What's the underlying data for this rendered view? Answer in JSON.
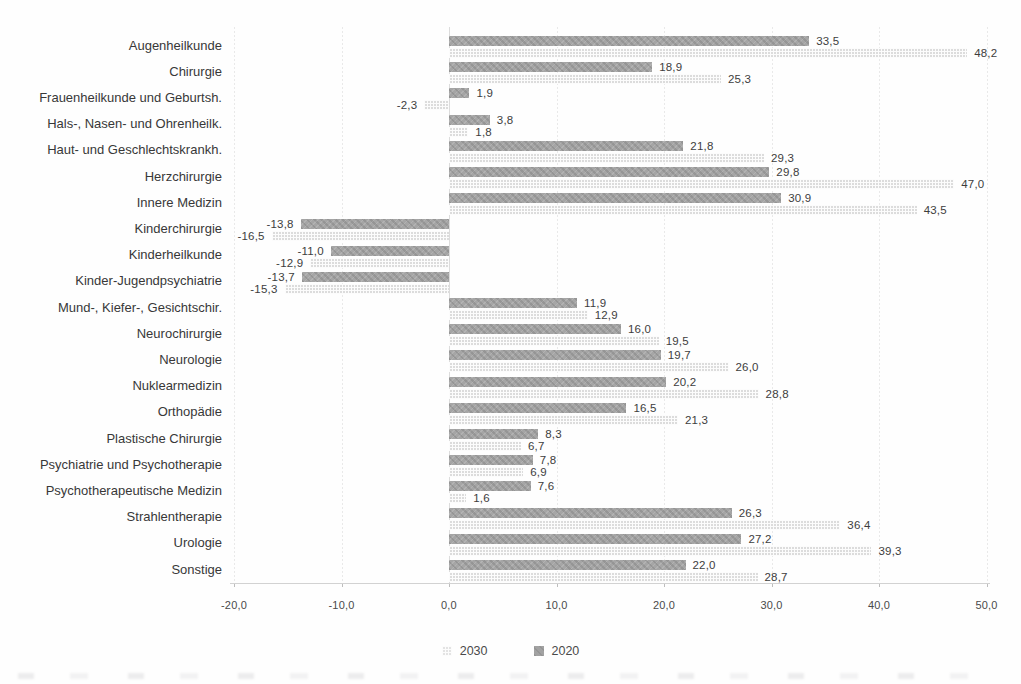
{
  "chart_data": {
    "type": "bar",
    "orientation": "horizontal",
    "title": "",
    "xlabel": "",
    "ylabel": "",
    "xlim": [
      -20,
      50
    ],
    "grid": "vertical-light",
    "legend_position": "bottom-center",
    "categories": [
      "Augenheilkunde",
      "Chirurgie",
      "Frauenheilkunde und Geburtsh.",
      "Hals-, Nasen- und Ohrenheilk.",
      "Haut- und Geschlechtskrankh.",
      "Herzchirurgie",
      "Innere Medizin",
      "Kinderchirurgie",
      "Kinderheilkunde",
      "Kinder-Jugendpsychiatrie",
      "Mund-, Kiefer-, Gesichtschir.",
      "Neurochirurgie",
      "Neurologie",
      "Nuklearmedizin",
      "Orthopädie",
      "Plastische Chirurgie",
      "Psychiatrie und Psychotherapie",
      "Psychotherapeutische Medizin",
      "Strahlentherapie",
      "Urologie",
      "Sonstige"
    ],
    "series": [
      {
        "name": "2020",
        "style": "dark-solid",
        "values": [
          33.5,
          18.9,
          1.9,
          3.8,
          21.8,
          29.8,
          30.9,
          -13.8,
          -11.0,
          -13.7,
          11.9,
          16.0,
          19.7,
          20.2,
          16.5,
          8.3,
          7.8,
          7.6,
          26.3,
          27.2,
          22.0
        ],
        "value_labels": [
          "33,5",
          "18,9",
          "1,9",
          "3,8",
          "21,8",
          "29,8",
          "30,9",
          "-13,8",
          "-11,0",
          "-13,7",
          "11,9",
          "16,0",
          "19,7",
          "20,2",
          "16,5",
          "8,3",
          "7,8",
          "7,6",
          "26,3",
          "27,2",
          "22,0"
        ]
      },
      {
        "name": "2030",
        "style": "light-grid",
        "values": [
          48.2,
          25.3,
          -2.3,
          1.8,
          29.3,
          47.0,
          43.5,
          -16.5,
          -12.9,
          -15.3,
          12.9,
          19.5,
          26.0,
          28.8,
          21.3,
          6.7,
          6.9,
          1.6,
          36.4,
          39.3,
          28.7
        ],
        "value_labels": [
          "48,2",
          "25,3",
          "-2,3",
          "1,8",
          "29,3",
          "47,0",
          "43,5",
          "-16,5",
          "-12,9",
          "-15,3",
          "12,9",
          "19,5",
          "26,0",
          "28,8",
          "21,3",
          "6,7",
          "6,9",
          "1,6",
          "36,4",
          "39,3",
          "28,7"
        ]
      }
    ],
    "x_ticks": [
      -20,
      -10,
      0,
      10,
      20,
      30,
      40,
      50
    ],
    "x_tick_labels": [
      "-20,0",
      "-10,0",
      "0,0",
      "10,0",
      "20,0",
      "30,0",
      "40,0",
      "50,0"
    ],
    "legend": [
      {
        "label": "2030",
        "style": "light-grid"
      },
      {
        "label": "2020",
        "style": "dark-solid"
      }
    ],
    "colors": {
      "series_2020_bar": "#a2a2a2",
      "series_2030_bar": "#e3e3e3",
      "value_label": "#3d3d3d",
      "category_label": "#383838",
      "tick_label": "#4a4a4a",
      "gridline": "#e9e9e9",
      "axis_line": "#d2d2d2"
    }
  }
}
